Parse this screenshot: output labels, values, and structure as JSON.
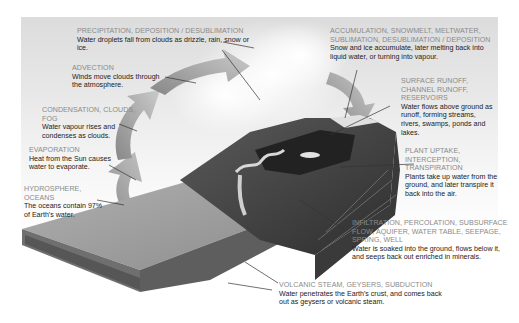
{
  "diagram": {
    "type": "water-cycle",
    "colors": {
      "background_top": "#dcdcdc",
      "arrow": "#9a9a9a",
      "ocean_top": "#9c9c9c",
      "ocean_side": "#6f6f6f",
      "land": "#4a4a4a",
      "leader_line": "#333333",
      "heading_text": "#8a8a8a",
      "body_text": "#222222"
    },
    "labels": [
      {
        "id": "precipitation",
        "heading": "PRECIPITATION, DEPOSITION / DESUBLIMATION",
        "body": "Water droplets fall from clouds as drizzle, rain, snow or ice."
      },
      {
        "id": "advection",
        "heading": "ADVECTION",
        "body": "Winds move clouds through the atmosphere."
      },
      {
        "id": "condensation",
        "heading": "CONDENSATION, CLOUDS, FOG",
        "body": "Water vapour rises and condenses as clouds."
      },
      {
        "id": "evaporation",
        "heading": "EVAPORATION",
        "body": "Heat from the Sun causes water to evaporate."
      },
      {
        "id": "hydrosphere",
        "heading": "HYDROSPHERE, OCEANS",
        "body": "The oceans contain 97% of Earth's water."
      },
      {
        "id": "accumulation",
        "heading": "ACCUMULATION, SNOWMELT, MELTWATER, SUBLIMATION, DESUBLIMATION / DEPOSITION",
        "body": "Snow and ice accumulate, later melting back into liquid water, or turning into vapour."
      },
      {
        "id": "surface_runoff",
        "heading": "SURFACE RUNOFF, CHANNEL RUNOFF, RESERVOIRS",
        "body": "Water flows above ground as runoff, forming streams, rivers, swamps, ponds and lakes."
      },
      {
        "id": "plant_uptake",
        "heading": "PLANT UPTAKE, INTERCEPTION, TRANSPIRATION",
        "body": "Plants take up water from the ground, and later transpire it back into the air."
      },
      {
        "id": "infiltration",
        "heading": "INFILTRATION, PERCOLATION, SUBSURFACE FLOW, AQUIFER, WATER TABLE, SEEPAGE, SPRING, WELL",
        "body": "Water is soaked into the ground, flows below it, and seeps back out enriched in minerals."
      },
      {
        "id": "volcanic",
        "heading": "VOLCANIC STEAM, GEYSERS, SUBDUCTION",
        "body": "Water penetrates the Earth's crust, and comes back out as geysers or volcanic steam."
      }
    ]
  }
}
